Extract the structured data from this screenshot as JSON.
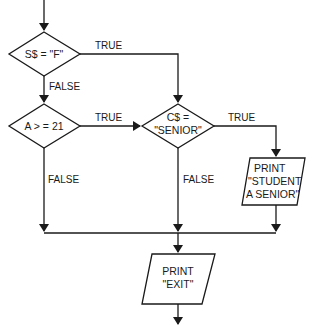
{
  "diagram": {
    "type": "flowchart",
    "nodes": [
      {
        "id": "d1",
        "shape": "decision",
        "lines": [
          "S$ = \"F\""
        ]
      },
      {
        "id": "d2",
        "shape": "decision",
        "lines": [
          "A > = 21"
        ]
      },
      {
        "id": "d3",
        "shape": "decision",
        "lines": [
          "C$ =",
          "\"SENIOR\""
        ]
      },
      {
        "id": "io1",
        "shape": "io",
        "lines": [
          "PRINT",
          "\"STUDENT",
          "A SENIOR\""
        ]
      },
      {
        "id": "io2",
        "shape": "io",
        "lines": [
          "PRINT",
          "\"EXIT\""
        ]
      }
    ],
    "edges": [
      {
        "from": "start",
        "to": "d1",
        "label": ""
      },
      {
        "from": "d1",
        "to": "d3",
        "label": "TRUE"
      },
      {
        "from": "d1",
        "to": "d2",
        "label": "FALSE"
      },
      {
        "from": "d2",
        "to": "d3",
        "label": "TRUE"
      },
      {
        "from": "d2",
        "to": "merge",
        "label": "FALSE"
      },
      {
        "from": "d3",
        "to": "io1",
        "label": "TRUE"
      },
      {
        "from": "d3",
        "to": "merge",
        "label": "FALSE"
      },
      {
        "from": "io1",
        "to": "merge",
        "label": ""
      },
      {
        "from": "merge",
        "to": "io2",
        "label": ""
      },
      {
        "from": "io2",
        "to": "end",
        "label": ""
      }
    ],
    "labels": {
      "d1_true": "TRUE",
      "d1_false": "FALSE",
      "d2_true": "TRUE",
      "d2_false": "FALSE",
      "d3_true": "TRUE",
      "d3_false": "FALSE"
    }
  }
}
